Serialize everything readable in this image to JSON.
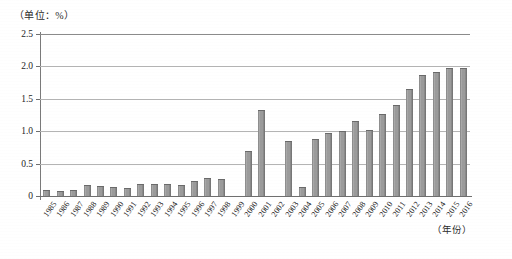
{
  "unit_caption": "（单位：%）",
  "xaxis_title": "（年份）",
  "chart_data": {
    "type": "bar",
    "title": "",
    "subtitle": "",
    "xlabel": "（年份）",
    "ylabel": "（单位：%）",
    "ylim": [
      0,
      2.5
    ],
    "ytick_labels": [
      "0",
      "0.5",
      "1.0",
      "1.5",
      "2.0",
      "2.5"
    ],
    "ytick_values": [
      0,
      0.5,
      1.0,
      1.5,
      2.0,
      2.5
    ],
    "grid": true,
    "legend": "none",
    "categories": [
      "1985",
      "1986",
      "1987",
      "1988",
      "1989",
      "1990",
      "1991",
      "1992",
      "1993",
      "1994",
      "1995",
      "1996",
      "1997",
      "1998",
      "1999",
      "2000",
      "2001",
      "2002",
      "2003",
      "2004",
      "2005",
      "2006",
      "2007",
      "2008",
      "2009",
      "2010",
      "2011",
      "2012",
      "2013",
      "2014",
      "2015",
      "2016"
    ],
    "values": [
      0.09,
      0.08,
      0.1,
      0.17,
      0.16,
      0.14,
      0.12,
      0.19,
      0.19,
      0.19,
      0.17,
      0.23,
      0.28,
      0.27,
      0,
      0.7,
      1.33,
      0,
      0.85,
      0.14,
      0.88,
      0.98,
      1.01,
      1.15,
      1.02,
      1.27,
      1.4,
      1.65,
      1.86,
      1.92,
      1.97,
      1.98
    ]
  }
}
